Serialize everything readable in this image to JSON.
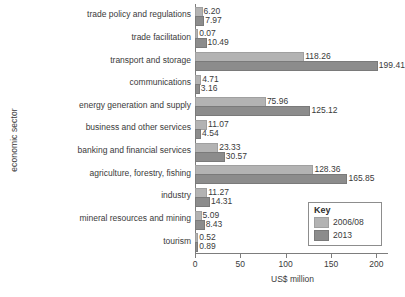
{
  "chart_data": {
    "type": "bar",
    "orientation": "horizontal",
    "title": "",
    "xlabel": "US$ million",
    "ylabel": "economic sector",
    "xlim": [
      0,
      215
    ],
    "xticks": [
      0,
      50,
      100,
      150,
      200
    ],
    "xtick_labels": [
      "0",
      "50",
      "100",
      "150",
      "200"
    ],
    "grid": false,
    "legend": {
      "title": "Key",
      "position": "lower-right",
      "entries": [
        "2006/08",
        "2013"
      ]
    },
    "categories": [
      "trade policy and regulations",
      "trade facilitation",
      "transport and storage",
      "communications",
      "energy generation and supply",
      "business and other services",
      "banking and financial services",
      "agriculture, forestry, fishing",
      "industry",
      "mineral resources and mining",
      "tourism"
    ],
    "series": [
      {
        "name": "2006/08",
        "color": "#b3b3b3",
        "values": [
          6.2,
          0.07,
          118.26,
          4.71,
          75.96,
          11.07,
          23.33,
          128.36,
          11.27,
          5.09,
          0.52
        ]
      },
      {
        "name": "2013",
        "color": "#8c8c8c",
        "values": [
          7.97,
          10.49,
          199.41,
          3.16,
          125.12,
          4.54,
          30.57,
          165.85,
          14.31,
          8.43,
          0.89
        ]
      }
    ],
    "value_labels": [
      [
        "6.20",
        "7.97"
      ],
      [
        "0.07",
        "10.49"
      ],
      [
        "118.26",
        "199.41"
      ],
      [
        "4.71",
        "3.16"
      ],
      [
        "75.96",
        "125.12"
      ],
      [
        "11.07",
        "4.54"
      ],
      [
        "23.33",
        "30.57"
      ],
      [
        "128.36",
        "165.85"
      ],
      [
        "11.27",
        "14.31"
      ],
      [
        "5.09",
        "8.43"
      ],
      [
        "0.52",
        "0.89"
      ]
    ]
  }
}
